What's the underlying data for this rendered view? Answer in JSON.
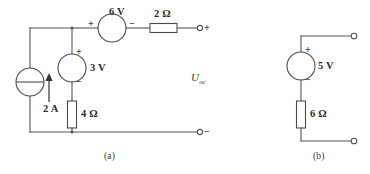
{
  "figure": {
    "type": "circuit-diagram",
    "background_color": "#ffffff",
    "line_color": "#555555",
    "text_color": "#2b2b2b",
    "captions": {
      "a": "(a)",
      "b": "(b)"
    }
  },
  "circuit_a": {
    "caption": "(a)",
    "open_circuit_voltage_label": "U",
    "open_circuit_voltage_subscript": "oc",
    "components": {
      "current_source": {
        "name": "2 A current source",
        "value": "2 A",
        "symbol": "circle-with-horizontal-bar",
        "arrow_direction": "up"
      },
      "voltage_source_3v": {
        "name": "3 V voltage source",
        "value": "3 V",
        "plus": "+",
        "minus": "−",
        "plus_position": "top",
        "minus_position": "bottom"
      },
      "voltage_source_6v": {
        "name": "6 V voltage source",
        "value": "6 V",
        "plus": "+",
        "minus": "−",
        "plus_position": "left",
        "minus_position": "right"
      },
      "resistor_2ohm": {
        "name": "2 ohm resistor",
        "value": "2 Ω",
        "orientation": "horizontal"
      },
      "resistor_4ohm": {
        "name": "4 ohm resistor",
        "value": "4 Ω",
        "orientation": "vertical"
      }
    },
    "terminals": {
      "positive": "+",
      "negative": "−"
    }
  },
  "circuit_b": {
    "caption": "(b)",
    "components": {
      "voltage_source_5v": {
        "name": "5 V voltage source",
        "value": "5 V",
        "plus": "+",
        "minus": "−",
        "plus_position": "top",
        "minus_position": "bottom"
      },
      "resistor_6ohm": {
        "name": "6 ohm resistor",
        "value": "6 Ω",
        "orientation": "vertical"
      }
    },
    "terminals": {
      "top": "open-terminal",
      "bottom": "open-terminal"
    }
  }
}
